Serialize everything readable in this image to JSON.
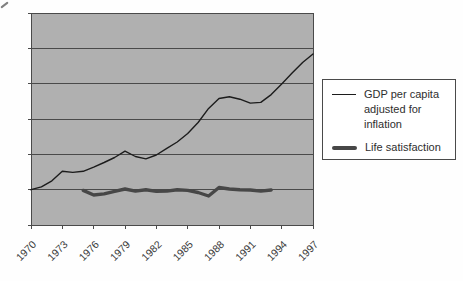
{
  "chart_data": {
    "type": "line",
    "x": [
      1970,
      1971,
      1972,
      1973,
      1974,
      1975,
      1976,
      1977,
      1978,
      1979,
      1980,
      1981,
      1982,
      1983,
      1984,
      1985,
      1986,
      1987,
      1988,
      1989,
      1990,
      1991,
      1992,
      1993,
      1994,
      1995,
      1996,
      1997
    ],
    "series": [
      {
        "name": "GDP per capita adjusted for inflation",
        "color": "#1c1c1c",
        "width": 1.4,
        "values": [
          1.0,
          1.08,
          1.25,
          1.52,
          1.49,
          1.52,
          1.64,
          1.77,
          1.91,
          2.09,
          1.94,
          1.87,
          1.98,
          2.17,
          2.35,
          2.59,
          2.9,
          3.3,
          3.58,
          3.63,
          3.56,
          3.45,
          3.47,
          3.69,
          3.99,
          4.3,
          4.6,
          4.84
        ]
      },
      {
        "name": "Life satisfaction",
        "color": "#474747",
        "width": 3.4,
        "values": [
          null,
          null,
          null,
          null,
          null,
          0.98,
          0.85,
          0.88,
          0.95,
          1.02,
          0.96,
          1.0,
          0.95,
          0.96,
          1.0,
          0.98,
          0.92,
          0.82,
          1.06,
          1.02,
          1.0,
          0.99,
          0.96,
          0.99,
          null,
          null,
          null,
          null
        ]
      }
    ],
    "title": "",
    "xlabel": "",
    "ylabel": "",
    "x_tick_labels": [
      "1970",
      "1973",
      "1976",
      "1979",
      "1982",
      "1985",
      "1988",
      "1991",
      "1994",
      "1997"
    ],
    "x_tick_rotation_deg": 45,
    "xlim": [
      1970,
      1997
    ],
    "ylim": [
      0,
      6
    ],
    "y_gridline_step": 1,
    "y_tick_labels_visible": false,
    "grid": "horizontal",
    "legend_position": "right",
    "plot_bg": "#b0b0b0",
    "axis_color": "#4a4a4a",
    "tick_label_color": "#3a3a3a"
  },
  "legend": {
    "items": [
      {
        "label": "GDP per capita adjusted for inflation",
        "swatch": "thin-line"
      },
      {
        "label": "Life satisfaction",
        "swatch": "thick-line"
      }
    ]
  }
}
